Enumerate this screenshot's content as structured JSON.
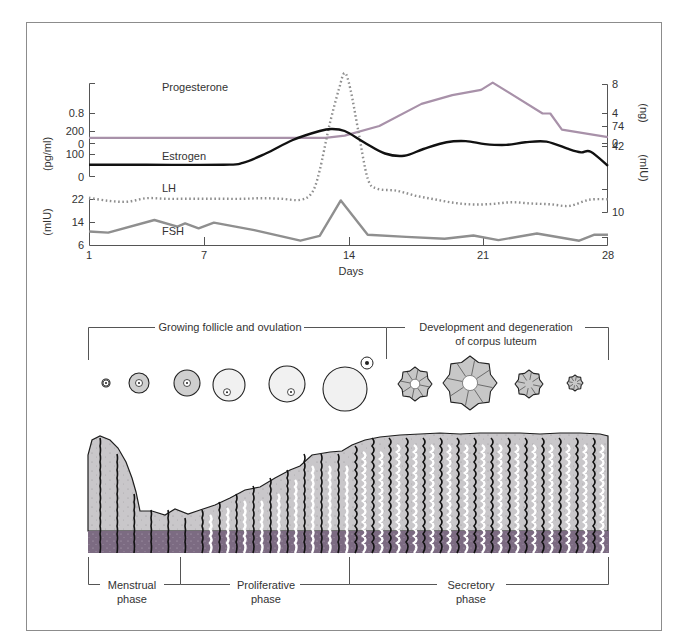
{
  "figure": {
    "colors": {
      "frame": "#8c8c8c",
      "axis": "#555555",
      "progesterone": "#a891a9",
      "estrogen": "#111111",
      "lh": "#8f8f8f",
      "fsh": "#8f8f8f",
      "tissue": "#c9c7ca",
      "tissue_outline": "#1e1e1e",
      "basal": "#7c6b82",
      "follicle_fill": "#d9d9d9",
      "corpus_fill": "#c7c7c7"
    }
  },
  "chart_data": {
    "type": "line",
    "title": "",
    "xlabel": "Days",
    "x_ticks": [
      1,
      7,
      14,
      21,
      28
    ],
    "xlim": [
      1,
      28
    ],
    "grid": false,
    "legend": "inline labels",
    "panels": [
      {
        "name": "Progesterone",
        "left_axis": {
          "ticks": [
            "0",
            "0.8"
          ],
          "label": ""
        },
        "right_axis": {
          "ticks": [
            "0",
            "4",
            "8"
          ],
          "label": "(ng)"
        },
        "ylim": [
          0,
          8
        ],
        "series": [
          {
            "name": "Progesterone",
            "unit": "ng/ml",
            "style": "solid-mauve",
            "x": [
              1,
              5,
              10,
              13.3,
              14.3,
              16.1,
              18.3,
              19.9,
              21.4,
              22.0,
              24.6,
              25.0,
              25.6,
              28.0
            ],
            "y": [
              0.7,
              0.7,
              0.7,
              0.7,
              1.0,
              2.3,
              5.3,
              6.5,
              7.2,
              8.2,
              4.0,
              4.0,
              1.8,
              0.8
            ]
          }
        ]
      },
      {
        "name": "Estrogen / LH",
        "left_axis": {
          "ticks": [
            "0",
            "100",
            "200"
          ],
          "label": "(pg/ml)"
        },
        "right_axis": {
          "ticks": [
            "10",
            "42",
            "74"
          ],
          "label": "(mIU)"
        },
        "series": [
          {
            "name": "Estrogen",
            "unit": "pg/ml",
            "style": "solid-black",
            "x": [
              1,
              4,
              8,
              9,
              10.2,
              11.6,
              13.0,
              13.6,
              14.3,
              15.3,
              16.4,
              17.4,
              18.4,
              19.6,
              20.6,
              21.6,
              22.7,
              23.7,
              24.8,
              26.0,
              26.6,
              27.1,
              28.0
            ],
            "y": [
              50,
              50,
              50,
              58,
              100,
              160,
              200,
              209,
              200,
              150,
              100,
              90,
              120,
              150,
              155,
              142,
              138,
              150,
              153,
              118,
              105,
              108,
              45
            ]
          },
          {
            "name": "LH",
            "unit": "mIU/ml",
            "style": "dotted-grey",
            "x": [
              1,
              2,
              3,
              4,
              5,
              6,
              7,
              8,
              9,
              10,
              11,
              12,
              12.6,
              13.0,
              13.5,
              14.0,
              14.3,
              14.6,
              15.0,
              15.5,
              16.0,
              17,
              18,
              19,
              20,
              21,
              22,
              23,
              24,
              25,
              26,
              27,
              28
            ],
            "y": [
              16.5,
              15.0,
              14.6,
              16.3,
              16.0,
              16.0,
              16.0,
              16.0,
              16.0,
              16.3,
              16.0,
              15.5,
              19.0,
              30.0,
              52.0,
              70.0,
              78.0,
              70.0,
              50.0,
              26.0,
              21.0,
              20.0,
              17.5,
              15.7,
              14.0,
              13.2,
              13.5,
              14.3,
              13.7,
              13.3,
              12.5,
              15.5,
              15.8
            ]
          }
        ]
      },
      {
        "name": "FSH",
        "left_axis": {
          "ticks": [
            "6",
            "14",
            "22"
          ],
          "label": "(mIU)"
        },
        "right_axis": {
          "ticks": [],
          "label": ""
        },
        "ylim": [
          6,
          22
        ],
        "series": [
          {
            "name": "FSH",
            "unit": "mIU/ml",
            "style": "solid-grey",
            "x": [
              1,
              2.0,
              4.4,
              5.6,
              6.0,
              6.7,
              7.5,
              9.6,
              12.0,
              13.0,
              14.1,
              15.5,
              17.5,
              19.5,
              21.0,
              22.3,
              24.3,
              26.5,
              27.3,
              28.0
            ],
            "y": [
              10.7,
              10.3,
              14.7,
              12.4,
              13.5,
              11.8,
              13.8,
              11.2,
              7.5,
              9.2,
              21.5,
              9.6,
              8.8,
              8.2,
              9.3,
              7.7,
              10.0,
              7.5,
              9.6,
              9.6
            ]
          }
        ]
      }
    ],
    "annotations": [
      "Progesterone",
      "Estrogen",
      "LH",
      "FSH"
    ]
  },
  "labels": {
    "progesterone": "Progesterone",
    "estrogen": "Estrogen",
    "lh": "LH",
    "fsh": "FSH",
    "days": "Days",
    "unit_pgml": "(pg/ml)",
    "unit_miu_left": "(mIU)",
    "unit_ng": "(ng)",
    "unit_miu_right": "(mIU)",
    "x_ticks": [
      "1",
      "7",
      "14",
      "21",
      "28"
    ],
    "prog_left_ticks": [
      "0.8",
      "0"
    ],
    "prog_right_ticks": [
      "8",
      "4",
      "0"
    ],
    "estr_left_ticks": [
      "200",
      "100",
      "0"
    ],
    "lh_right_ticks": [
      "74",
      "42",
      "10"
    ],
    "fsh_left_ticks": [
      "22",
      "14",
      "6"
    ]
  },
  "ovary": {
    "follicle_section": "Growing follicle and ovulation",
    "corpus_section_line1": "Development and degeneration",
    "corpus_section_line2": "of corpus luteum",
    "follicles": [
      {
        "stage": "primordial",
        "cx": 106,
        "cy": 383,
        "r": 4
      },
      {
        "stage": "primary",
        "cx": 139,
        "cy": 383,
        "r": 10
      },
      {
        "stage": "secondary",
        "cx": 187,
        "cy": 383,
        "r": 13
      },
      {
        "stage": "early antral",
        "cx": 229,
        "cy": 385,
        "r": 16
      },
      {
        "stage": "antral",
        "cx": 287,
        "cy": 384,
        "r": 18
      },
      {
        "stage": "ovulation",
        "cx": 345,
        "cy": 389,
        "r": 22
      }
    ],
    "corpora": [
      {
        "stage": "developing corpus luteum",
        "cx": 415,
        "cy": 384,
        "r": 17
      },
      {
        "stage": "mature corpus luteum",
        "cx": 470,
        "cy": 383,
        "r": 27
      },
      {
        "stage": "regressing corpus luteum",
        "cx": 529,
        "cy": 384,
        "r": 14
      },
      {
        "stage": "corpus albicans",
        "cx": 575,
        "cy": 383,
        "r": 8
      }
    ]
  },
  "endometrium": {
    "menstrual_line1": "Menstrual",
    "menstrual_line2": "phase",
    "proliferative_line1": "Proliferative",
    "proliferative_line2": "phase",
    "secretory_line1": "Secretory",
    "secretory_line2": "phase"
  }
}
